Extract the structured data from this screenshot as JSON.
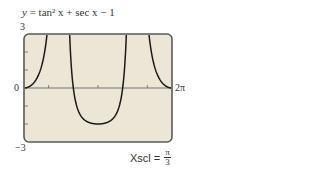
{
  "chart_data": {
    "type": "line",
    "title": "y = tan² x + sec x − 1",
    "function": "tan^2(x) + sec(x) - 1",
    "xlabel": "",
    "ylabel": "",
    "xlim": [
      0,
      6.2832
    ],
    "ylim": [
      -3,
      3
    ],
    "x_tick_labels": [
      "0",
      "2π"
    ],
    "y_tick_labels": [
      "3",
      "0",
      "−3"
    ],
    "xscl": "π/3",
    "yscl": 1,
    "grid": false,
    "asymptotes": [
      "π/2",
      "3π/2"
    ],
    "series": [
      {
        "name": "y = tan² x + sec x − 1",
        "x": [
          0,
          0.5236,
          1.0472,
          1.309,
          1.4,
          1.75,
          1.8326,
          2.0944,
          2.618,
          3.1416,
          3.6652,
          4.1888,
          4.4506,
          4.53,
          4.88,
          4.9742,
          5.236,
          5.7596,
          6.2832
        ],
        "y": [
          0,
          0.488,
          2,
          3.0,
          3.0,
          -3.0,
          -2.35,
          -0.0,
          -1.488,
          -2,
          -1.488,
          0,
          -2.35,
          -3.0,
          3.0,
          3.0,
          2,
          0.488,
          0
        ]
      }
    ]
  },
  "labels": {
    "title_prefix": "y = ",
    "title_func": "tan² x + sec x − 1",
    "y_max": "3",
    "y_zero": "0",
    "y_min": "−3",
    "x_max": "2π",
    "xscl_label": "Xscl =",
    "xscl_num": "π",
    "xscl_den": "3"
  },
  "colors": {
    "screen_bg": "#ece6d6",
    "frame": "#5a5a5a",
    "curve": "#1a1a1a",
    "axis": "#666666"
  }
}
